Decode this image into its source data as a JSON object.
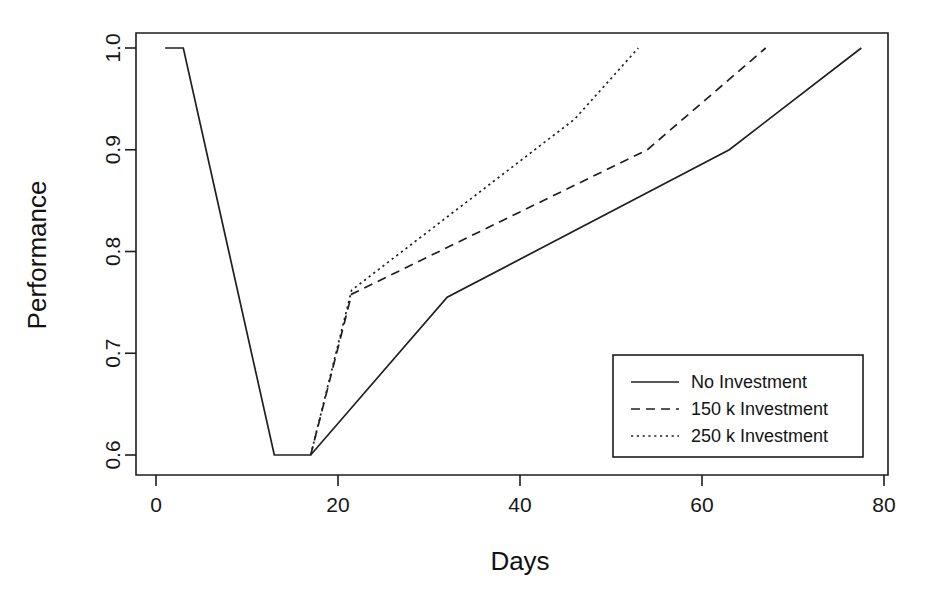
{
  "chart_data": {
    "type": "line",
    "title": "",
    "xlabel": "Days",
    "ylabel": "Performance",
    "xlim": [
      0,
      80
    ],
    "ylim": [
      0.6,
      1.0
    ],
    "xticks": [
      "0",
      "20",
      "40",
      "60",
      "80"
    ],
    "xtick_values": [
      0,
      20,
      40,
      60,
      80
    ],
    "yticks": [
      "0.6",
      "0.7",
      "0.8",
      "0.9",
      "1.0"
    ],
    "ytick_values": [
      0.6,
      0.7,
      0.8,
      0.9,
      1.0
    ],
    "grid": false,
    "legend_position": "bottom-right",
    "series": [
      {
        "name": "No Investment",
        "style": "solid",
        "x": [
          1,
          3,
          13,
          17,
          32,
          63,
          77.5
        ],
        "y": [
          1.0,
          1.0,
          0.6,
          0.6,
          0.755,
          0.9,
          1.0
        ]
      },
      {
        "name": "150 k Investment",
        "style": "dashed",
        "x": [
          17,
          21.5,
          54,
          67
        ],
        "y": [
          0.6,
          0.758,
          0.9,
          1.0
        ]
      },
      {
        "name": "250 k Investment",
        "style": "dotted",
        "x": [
          17,
          21.5,
          46,
          53
        ],
        "y": [
          0.6,
          0.762,
          0.93,
          1.0
        ]
      }
    ]
  },
  "legend": {
    "entries": [
      {
        "label": "No Investment"
      },
      {
        "label": "150 k Investment"
      },
      {
        "label": "250 k Investment"
      }
    ]
  },
  "colors": {
    "ink": "#1f1f1f",
    "background": "#ffffff"
  }
}
